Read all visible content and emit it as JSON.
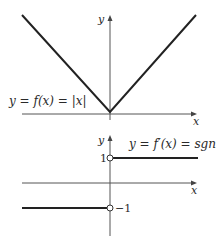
{
  "top_graph": {
    "function_label": "y = f(x) = |x|",
    "y_axis_label": "y",
    "x_axis_label": "x",
    "description": "Graph of absolute value function, V shape with vertex at origin"
  },
  "bottom_graph": {
    "function_label": "y = f′(x) = sgn x",
    "y_axis_label": "y",
    "x_axis_label": "x",
    "tick_labels": {
      "positive": "1",
      "negative": "−1"
    },
    "description": "Graph of sign function: y = 1 for x > 0, y = −1 for x < 0, open circles at (0,1) and (0,−1)"
  },
  "colors": {
    "curve": "#222222",
    "axis": "#555555",
    "background": "#ffffff"
  }
}
